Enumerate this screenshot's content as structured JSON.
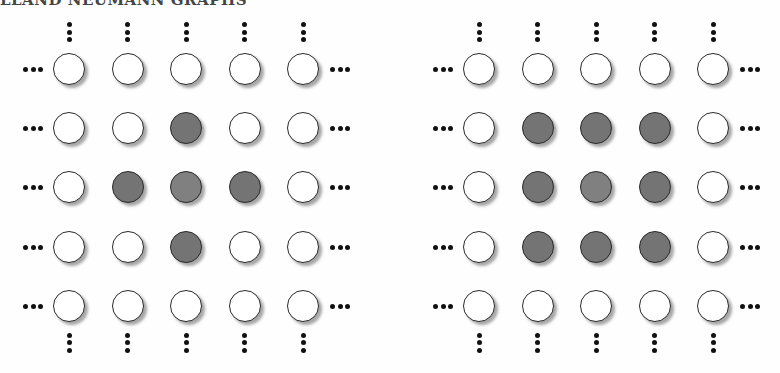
{
  "title": "LLAND NEUMANN GRAPHS",
  "colors": {
    "empty": "#ffffff",
    "filled": "#747474",
    "center_filled": "#808080",
    "border": "#2a2a2a"
  },
  "panels": [
    {
      "name": "von-neumann-neighborhood",
      "origin_x": 69,
      "grid": [
        [
          0,
          0,
          0,
          0,
          0
        ],
        [
          0,
          0,
          1,
          0,
          0
        ],
        [
          0,
          1,
          2,
          1,
          0
        ],
        [
          0,
          0,
          1,
          0,
          0
        ],
        [
          0,
          0,
          0,
          0,
          0
        ]
      ]
    },
    {
      "name": "moore-neighborhood",
      "origin_x": 479,
      "grid": [
        [
          0,
          0,
          0,
          0,
          0
        ],
        [
          0,
          1,
          1,
          1,
          0
        ],
        [
          0,
          1,
          2,
          1,
          0
        ],
        [
          0,
          1,
          1,
          1,
          0
        ],
        [
          0,
          0,
          0,
          0,
          0
        ]
      ]
    }
  ],
  "layout": {
    "col_spacing": 58.5,
    "row_spacing": 59.2,
    "first_row_y": 69
  }
}
